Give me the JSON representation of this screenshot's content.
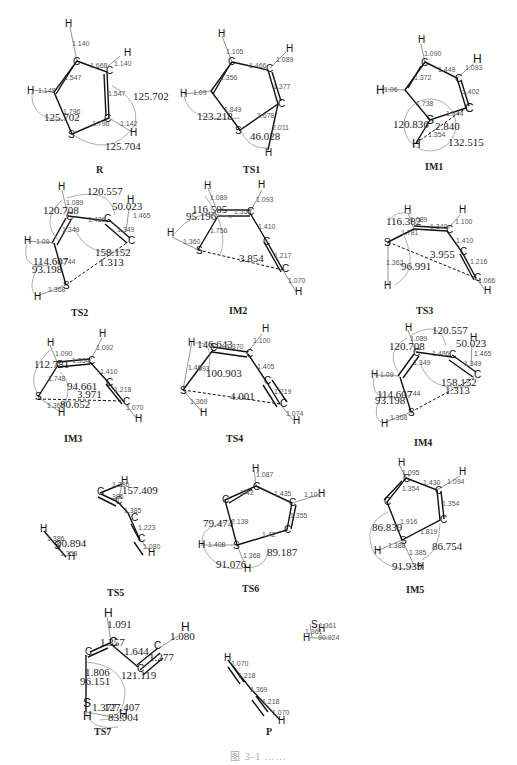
{
  "figure": {
    "caption": "图 3-1 ……",
    "structures": [
      {
        "name": "R",
        "bonds": [
          "1.140",
          "1.668",
          "1.140",
          "1.547",
          "1.547",
          "1.148",
          "1.796",
          "1.796",
          "1.142"
        ],
        "angles": [
          "125.702",
          "125.702",
          "125.704"
        ]
      },
      {
        "name": "TS1",
        "bonds": [
          "1.105",
          "1.466",
          "1.089",
          "1.356",
          "1.377",
          "1.09",
          "1.849",
          "1.678",
          "2.011"
        ],
        "angles": [
          "123.218",
          "46.028"
        ]
      },
      {
        "name": "IM1",
        "bonds": [
          "1.090",
          "1.449",
          "1.093",
          "1.372",
          "1.402",
          "1.06",
          "1.738",
          "1.344",
          "2.840",
          "1.354"
        ],
        "angles": [
          "120.836",
          "132.515"
        ]
      },
      {
        "name": "TS2",
        "bonds": [
          "1.089",
          "1.486",
          "1.465",
          "1.349",
          "1.09",
          "1.744",
          "1.313",
          "1.368"
        ],
        "angles": [
          "120.557",
          "120.708",
          "50.023",
          "158.152",
          "114.607",
          "93.198"
        ]
      },
      {
        "name": "IM2",
        "bonds": [
          "1.089",
          "1.354",
          "1.093",
          "1.410",
          "1.217",
          "1.070",
          "1.756",
          "1.360",
          "3.854"
        ],
        "angles": [
          "116.505",
          "95.196"
        ]
      },
      {
        "name": "TS3",
        "bonds": [
          "1.089",
          "1.349",
          "1.100",
          "1.781",
          "1.410",
          "1.216",
          "1.066",
          "1.362",
          "3.955"
        ],
        "angles": [
          "116.382",
          "96.991"
        ]
      },
      {
        "name": "IM3",
        "bonds": [
          "1.090",
          "1.354",
          "1.092",
          "1.410",
          "1.748",
          "1.218",
          "1.070",
          "1.367",
          "3.971"
        ],
        "angles": [
          "112.781",
          "94.661",
          "80.652"
        ]
      },
      {
        "name": "TS4",
        "bonds": [
          "1.370",
          "1.100",
          "1.405",
          "1.219",
          "1.074",
          "1.369",
          "4.001"
        ],
        "angles": [
          "146.643",
          "100.903",
          "148.993"
        ]
      },
      {
        "name": "IM4",
        "bonds": [
          "1.089",
          "1.486",
          "1.465",
          "1.349",
          "1.09",
          "1.744",
          "1.313",
          "1.368"
        ],
        "angles": [
          "120.557",
          "120.708",
          "50.023",
          "158.152",
          "114.607",
          "93.198"
        ]
      },
      {
        "name": "TS5",
        "bonds": [
          "1.386",
          "1.385",
          "1.223",
          "1.080",
          "1.386",
          "1.358"
        ],
        "angles": [
          "157.409",
          "90.894"
        ]
      },
      {
        "name": "TS6",
        "bonds": [
          "1.087",
          "1.435",
          "1.101",
          "1.355",
          "1.42",
          "2.139",
          "1.408",
          "1.368"
        ],
        "angles": [
          "79.474",
          "89.187",
          "91.076"
        ]
      },
      {
        "name": "IM5",
        "bonds": [
          "1.095",
          "1.430",
          "1.094",
          "1.354",
          "1.354",
          "1.916",
          "1.819",
          "1.388",
          "1.385"
        ],
        "angles": [
          "86.839",
          "86.754",
          "91.939"
        ]
      },
      {
        "name": "TS7",
        "bonds": [
          "1.091",
          "1.357",
          "1.080",
          "1.644",
          "1.277",
          "1.806",
          "1.377"
        ],
        "angles": [
          "121.119",
          "96.151",
          "127.407",
          "83.904"
        ]
      },
      {
        "name": "P",
        "bonds": [
          "1.070",
          "1.218",
          "1.369",
          "1.218",
          "1.070"
        ],
        "angles": []
      },
      {
        "name": "H2S",
        "bonds": [
          "1.361",
          "1.361"
        ],
        "angles": [
          "90.924"
        ]
      }
    ]
  }
}
